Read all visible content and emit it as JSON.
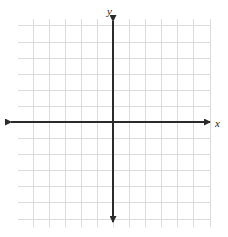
{
  "figure": {
    "width": 228,
    "height": 237,
    "background_color": "#ffffff"
  },
  "axis_labels": {
    "y": "y",
    "x": "x"
  },
  "chart_data": {
    "type": "scatter",
    "title": "",
    "subtitle": "",
    "xlabel": "x",
    "ylabel": "y",
    "series": [],
    "x": [],
    "values": [],
    "annotations": [],
    "legend": [],
    "legend_position": "none",
    "grid": true,
    "grid_color": "#dcdcdc",
    "grid_spacing_px": 16.1,
    "grid_columns": 12,
    "grid_rows": 13,
    "grid_left_px": 18,
    "grid_right_px": 211,
    "grid_top_px": 19,
    "grid_bottom_px": 227,
    "axis_color": "#2b2b2b",
    "axis_width_px": 2,
    "origin_x_px": 113,
    "origin_y_px": 122,
    "x_axis_start_px": 11,
    "x_axis_end_px": 210,
    "y_axis_start_px": 21,
    "y_axis_end_px": 222,
    "x_arrow_left": true,
    "x_arrow_right": true,
    "y_arrow_up": true,
    "y_arrow_down": true,
    "xlim": [
      -6,
      6
    ],
    "ylim": [
      -6.5,
      6.5
    ],
    "tick_labels_x": [],
    "tick_labels_y": []
  }
}
